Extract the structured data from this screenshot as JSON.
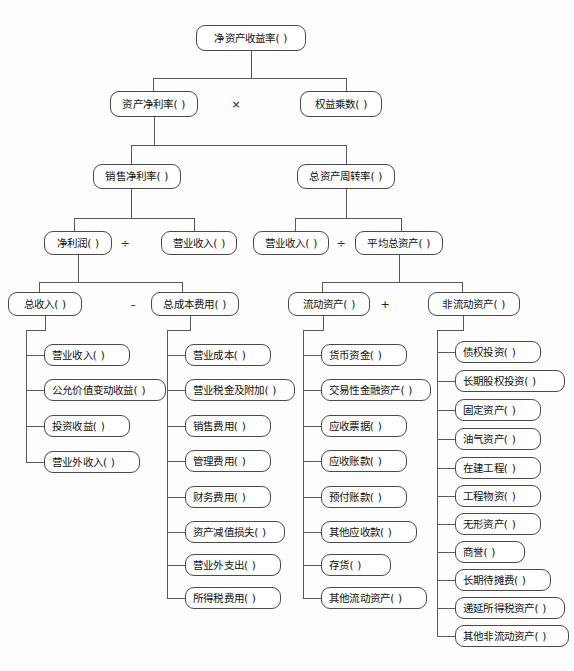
{
  "diagram": {
    "blank": "(        )",
    "operators": {
      "multiply": "×",
      "divide": "÷",
      "minus": "–",
      "plus": "+"
    }
  },
  "nodes": {
    "root": "净资产收益率(       )",
    "l2_left": "资产净利率(      )",
    "l2_right": "权益乘数(      )",
    "l3_left": "销售净利率(      )",
    "l3_right": "总资产周转率(      )",
    "l4_a": "净利润(     )",
    "l4_b": "营业收入(     )",
    "l4_c": "营业收入(     )",
    "l4_d": "平均总资产(      )",
    "l5_a": "总收入(      )",
    "l5_b": "总成本费用(      )",
    "l5_c": "流动资产(      )",
    "l5_d": "非流动资产(      )"
  },
  "columns": {
    "total_income": {
      "parent": "总收入",
      "items": [
        "营业收入(      )",
        "公允价值变动收益(      )",
        "投资收益(      )",
        "营业外收入(      )"
      ]
    },
    "total_cost": {
      "parent": "总成本费用",
      "items": [
        "营业成本(      )",
        "营业税金及附加(      )",
        "销售费用(      )",
        "管理费用(      )",
        "财务费用(      )",
        "资产减值损失(      )",
        "营业外支出(      )",
        "所得税费用(      )"
      ]
    },
    "current_assets": {
      "parent": "流动资产",
      "items": [
        "货币资金(      )",
        "交易性金融资产(      )",
        "应收票据(      )",
        "应收账款(      )",
        "预付账款(      )",
        "其他应收款(      )",
        "存货(      )",
        "其他流动资产(      )"
      ]
    },
    "noncurrent_assets": {
      "parent": "非流动资产",
      "items": [
        "债权投资(      )",
        "长期股权投资(      )",
        "固定资产(      )",
        "油气资产(      )",
        "在建工程(      )",
        "工程物资(      )",
        "无形资产(      )",
        "商誉(      )",
        "长期待摊费(      )",
        "递延所得税资产(      )",
        "其他非流动资产(      )"
      ]
    }
  },
  "colors": {
    "line": "#5a5a5a",
    "border": "#4a4a4a",
    "text": "#111111",
    "background": "#fdfdfd"
  }
}
